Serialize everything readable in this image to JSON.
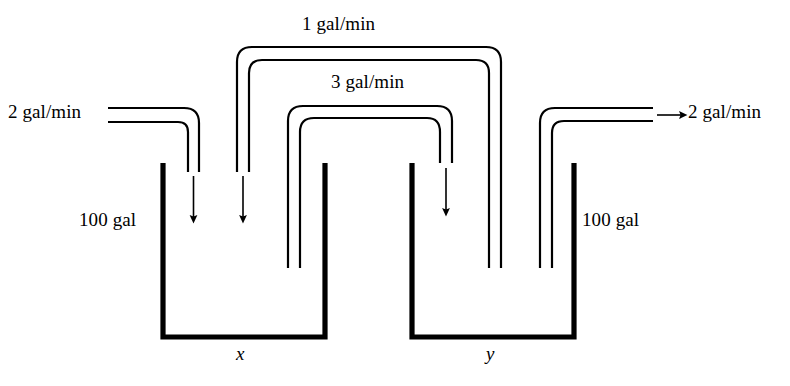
{
  "diagram": {
    "stroke_color": "#000000",
    "background_color": "#ffffff",
    "labels": {
      "flow_top_outer": "1 gal/min",
      "flow_top_inner": "3 gal/min",
      "flow_inlet": "2 gal/min",
      "flow_outlet": "2 gal/min",
      "volume_left": "100 gal",
      "volume_right": "100 gal",
      "tank_left": "x",
      "tank_right": "y"
    },
    "tanks": [
      {
        "name": "tank-left",
        "label": "x",
        "volume": "100 gal"
      },
      {
        "name": "tank-right",
        "label": "y",
        "volume": "100 gal"
      }
    ],
    "flows": [
      {
        "name": "inlet",
        "rate": "2 gal/min",
        "from": "external",
        "to": "tank-left",
        "direction": "right-then-down"
      },
      {
        "name": "left-to-right",
        "rate": "3 gal/min",
        "from": "tank-left",
        "to": "tank-right",
        "direction": "up-over-down"
      },
      {
        "name": "right-to-left",
        "rate": "1 gal/min",
        "from": "tank-right",
        "to": "tank-left",
        "direction": "up-over-down"
      },
      {
        "name": "outlet",
        "rate": "2 gal/min",
        "from": "tank-right",
        "to": "external",
        "direction": "up-then-right"
      }
    ]
  }
}
